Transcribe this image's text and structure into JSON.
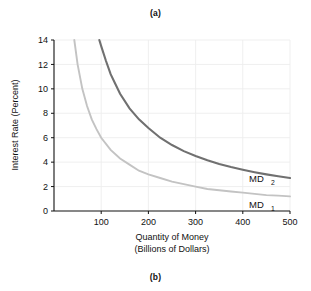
{
  "figure": {
    "panel_top_label": "(a)",
    "panel_bottom_label": "(b)"
  },
  "chart_data": {
    "type": "line",
    "title": "",
    "xlabel_line1": "Quantity of Money",
    "xlabel_line2": "(Billions of Dollars)",
    "ylabel": "Interest Rate (Percent)",
    "xlim": [
      0,
      500
    ],
    "ylim": [
      0,
      14
    ],
    "xticks": [
      100,
      200,
      300,
      400,
      500
    ],
    "yticks": [
      0,
      2,
      4,
      6,
      8,
      10,
      12,
      14
    ],
    "grid": true,
    "legend_position": "inline-right",
    "series": [
      {
        "name": "MD1",
        "label_base": "MD",
        "label_sub": "1",
        "color": "#c3c3c3",
        "relation": "i = 600 / Q",
        "x": [
          43,
          50,
          60,
          70,
          80,
          90,
          100,
          120,
          140,
          160,
          180,
          200,
          225,
          250,
          275,
          300,
          325,
          350,
          375,
          400,
          425,
          450,
          475,
          500
        ],
        "y": [
          14.0,
          12.0,
          10.0,
          8.6,
          7.5,
          6.7,
          6.0,
          5.0,
          4.3,
          3.8,
          3.3,
          3.0,
          2.7,
          2.4,
          2.2,
          2.0,
          1.8,
          1.7,
          1.6,
          1.5,
          1.4,
          1.3,
          1.26,
          1.2
        ]
      },
      {
        "name": "MD2",
        "label_base": "MD",
        "label_sub": "2",
        "color": "#707070",
        "relation": "i = 1350 / Q",
        "x": [
          96,
          100,
          110,
          120,
          130,
          140,
          160,
          180,
          200,
          225,
          250,
          275,
          300,
          325,
          350,
          375,
          400,
          425,
          450,
          475,
          500
        ],
        "y": [
          14.0,
          13.5,
          12.3,
          11.2,
          10.4,
          9.6,
          8.4,
          7.5,
          6.8,
          6.0,
          5.4,
          4.9,
          4.5,
          4.15,
          3.85,
          3.6,
          3.38,
          3.18,
          3.0,
          2.84,
          2.7
        ]
      }
    ]
  }
}
